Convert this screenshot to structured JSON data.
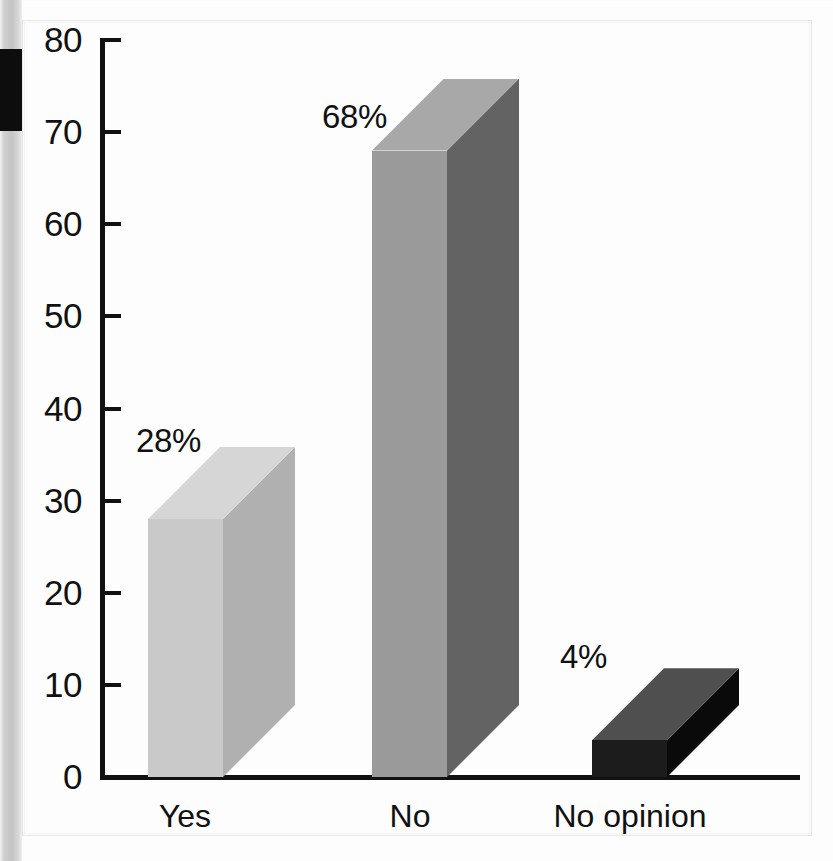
{
  "chart_data": {
    "type": "bar",
    "title": "",
    "subtitle": "",
    "xlabel": "",
    "ylabel": "",
    "categories": [
      "Yes",
      "No",
      "No opinion"
    ],
    "values": [
      28,
      68,
      4
    ],
    "data_labels": [
      "28%",
      "68%",
      "4%"
    ],
    "ylim": [
      0,
      80
    ],
    "ytick_step": 10,
    "ytick_labels": [
      "80",
      "70",
      "60",
      "50",
      "40",
      "30",
      "20",
      "10",
      "0"
    ],
    "ytick_values": [
      80,
      70,
      60,
      50,
      40,
      30,
      20,
      10,
      0
    ],
    "grid": false,
    "legend": false,
    "style": "3d-bars-grayscale",
    "series": [
      {
        "name": "Response share",
        "values": [
          28,
          68,
          4
        ],
        "unit": "%"
      }
    ],
    "bar_colors": {
      "yes_front": "#c9c9c9",
      "yes_top": "#d6d6d6",
      "yes_side": "#b0b0b0",
      "no_front": "#9a9a9a",
      "no_top": "#a8a8a8",
      "no_side": "#636363",
      "no_opinion_front": "#1c1c1c",
      "no_opinion_top": "#4f4f4f",
      "no_opinion_side": "#0a0a0a"
    },
    "axis_color": "#111111",
    "background_color": "#fdfdfd"
  }
}
